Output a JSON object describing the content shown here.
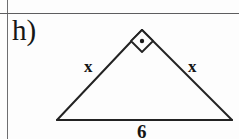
{
  "page": {
    "width": 239,
    "height": 139,
    "background_color": "#fdfdfd",
    "ink_color": "#161616",
    "rule_color": "#6e6e70"
  },
  "problem": {
    "part_label": "h)"
  },
  "figure": {
    "kind": "right-isosceles-triangle",
    "stroke_color": "#232323",
    "vertices": {
      "apex": {
        "x": 142,
        "y": 30
      },
      "bottom_left": {
        "x": 57,
        "y": 120
      },
      "bottom_right": {
        "x": 232,
        "y": 120
      }
    },
    "right_angle_marker": {
      "icon": "right-angle-square-dot-icon",
      "at_vertex": "apex",
      "half_size": 11,
      "dot_radius": 2.2
    },
    "labels": {
      "left_leg": "x",
      "right_leg": "x",
      "base": "6"
    }
  }
}
